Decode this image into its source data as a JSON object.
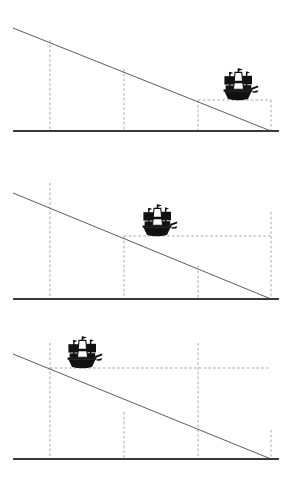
{
  "figure": {
    "width": 292,
    "height": 491,
    "background_color": "#ffffff",
    "baseline_color": "#3a3a3a",
    "slope_color": "#4a4a4a",
    "guide_color": "#9a9a9a",
    "ship_color": "#111111",
    "ship_icon_name": "sailing-ship-icon",
    "panel_count": 3
  },
  "panels": [
    {
      "id": "panel-1",
      "name": "panel-ship-far",
      "label": "Ship at far distance",
      "baseline": {
        "x1": 13,
        "y1": 131,
        "x2": 279,
        "y2": 131
      },
      "slope": {
        "x1": 13,
        "y1": 28,
        "x2": 271,
        "y2": 131
      },
      "verticals": [
        {
          "name": "guide-vertical-1",
          "x": 50,
          "y_top": 40,
          "y_bottom": 131
        },
        {
          "name": "guide-vertical-2",
          "x": 124,
          "y_top": 69,
          "y_bottom": 131
        },
        {
          "name": "guide-vertical-3",
          "x": 198,
          "y_top": 100,
          "y_bottom": 131
        },
        {
          "name": "guide-vertical-4",
          "x": 271,
          "y_top": 100,
          "y_bottom": 131
        }
      ],
      "horizontals": [
        {
          "name": "guide-horizontal-1",
          "y": 100,
          "x1": 198,
          "x2": 271
        }
      ],
      "ship": {
        "cx": 238,
        "cy": 86,
        "scale": 1.0,
        "waterline_y": 100
      }
    },
    {
      "id": "panel-2",
      "name": "panel-ship-middle",
      "label": "Ship at middle distance",
      "baseline": {
        "x1": 13,
        "y1": 299,
        "x2": 279,
        "y2": 299
      },
      "slope": {
        "x1": 13,
        "y1": 193,
        "x2": 271,
        "y2": 299
      },
      "verticals": [
        {
          "name": "guide-vertical-1",
          "x": 50,
          "y_top": 183,
          "y_bottom": 299
        },
        {
          "name": "guide-vertical-2",
          "x": 124,
          "y_top": 236,
          "y_bottom": 299
        },
        {
          "name": "guide-vertical-3",
          "x": 198,
          "y_top": 266,
          "y_bottom": 299
        },
        {
          "name": "guide-vertical-4",
          "x": 271,
          "y_top": 212,
          "y_bottom": 299
        }
      ],
      "horizontals": [
        {
          "name": "guide-horizontal-1",
          "y": 236,
          "x1": 124,
          "x2": 271
        }
      ],
      "ship": {
        "cx": 157,
        "cy": 222,
        "scale": 1.0,
        "waterline_y": 236
      }
    },
    {
      "id": "panel-3",
      "name": "panel-ship-near",
      "label": "Ship at near distance",
      "baseline": {
        "x1": 13,
        "y1": 459,
        "x2": 279,
        "y2": 459
      },
      "slope": {
        "x1": 13,
        "y1": 354,
        "x2": 271,
        "y2": 459
      },
      "verticals": [
        {
          "name": "guide-vertical-1",
          "x": 50,
          "y_top": 343,
          "y_bottom": 459
        },
        {
          "name": "guide-vertical-2",
          "x": 124,
          "y_top": 412,
          "y_bottom": 459
        },
        {
          "name": "guide-vertical-3",
          "x": 198,
          "y_top": 343,
          "y_bottom": 459
        },
        {
          "name": "guide-vertical-4",
          "x": 271,
          "y_top": 430,
          "y_bottom": 459
        }
      ],
      "horizontals": [
        {
          "name": "guide-horizontal-1",
          "y": 368,
          "x1": 50,
          "x2": 271
        }
      ],
      "ship": {
        "cx": 82,
        "cy": 354,
        "scale": 1.0,
        "waterline_y": 368
      }
    }
  ]
}
